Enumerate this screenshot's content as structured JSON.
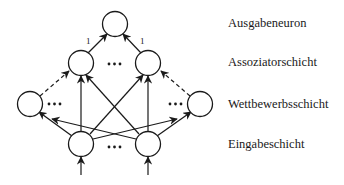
{
  "diagram": {
    "title": "",
    "layers": [
      {
        "id": "output",
        "label": "Ausgabeneuron",
        "y": 24
      },
      {
        "id": "association",
        "label": "Assoziatorschicht",
        "y": 63
      },
      {
        "id": "competition",
        "label": "Wettbewerbsschicht",
        "y": 104
      },
      {
        "id": "input",
        "label": "Eingabeschicht",
        "y": 144
      }
    ],
    "nodes": [
      {
        "id": "out",
        "layer": "output",
        "x": 115,
        "y": 24
      },
      {
        "id": "a1",
        "layer": "association",
        "x": 81,
        "y": 63
      },
      {
        "id": "a2",
        "layer": "association",
        "x": 148,
        "y": 63
      },
      {
        "id": "c1",
        "layer": "competition",
        "x": 30,
        "y": 104
      },
      {
        "id": "c2",
        "layer": "competition",
        "x": 200,
        "y": 104
      },
      {
        "id": "i1",
        "layer": "input",
        "x": 81,
        "y": 144
      },
      {
        "id": "i2",
        "layer": "input",
        "x": 148,
        "y": 144
      }
    ],
    "edges": [
      {
        "from": "a1",
        "to": "out",
        "style": "solid",
        "weight": "1"
      },
      {
        "from": "a2",
        "to": "out",
        "style": "solid",
        "weight": "1"
      },
      {
        "from": "c1",
        "to": "a1",
        "style": "dashed"
      },
      {
        "from": "c2",
        "to": "a2",
        "style": "dashed"
      },
      {
        "from": "i1",
        "to": "a1",
        "style": "solid"
      },
      {
        "from": "i1",
        "to": "a2",
        "style": "solid"
      },
      {
        "from": "i2",
        "to": "a1",
        "style": "solid"
      },
      {
        "from": "i2",
        "to": "a2",
        "style": "solid"
      },
      {
        "from": "i1",
        "to": "c1",
        "style": "solid"
      },
      {
        "from": "i1",
        "to": "c2",
        "style": "solid"
      },
      {
        "from": "i2",
        "to": "c1",
        "style": "solid"
      },
      {
        "from": "i2",
        "to": "c2",
        "style": "solid"
      },
      {
        "from": "external",
        "to": "i1",
        "style": "solid"
      },
      {
        "from": "external",
        "to": "i2",
        "style": "solid"
      }
    ],
    "ellipsis": "•••",
    "weight_labels": [
      "1",
      "1"
    ]
  }
}
